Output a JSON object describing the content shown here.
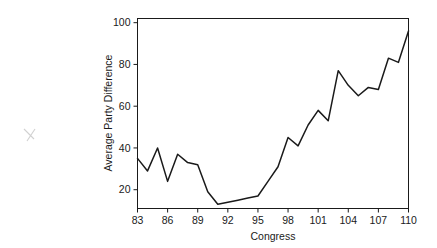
{
  "chart_data": {
    "type": "line",
    "title": "",
    "xlabel": "Congress",
    "ylabel": "Average Party Difference",
    "xlim": [
      83,
      110
    ],
    "ylim": [
      11,
      102
    ],
    "grid": false,
    "legend": null,
    "xticks": [
      83,
      86,
      89,
      92,
      95,
      98,
      101,
      104,
      107,
      110
    ],
    "xtick_labels": [
      "83",
      "86",
      "89",
      "92",
      "95",
      "98",
      "101",
      "104",
      "107",
      "110"
    ],
    "yticks": [
      20,
      40,
      60,
      80,
      100
    ],
    "ytick_labels": [
      "20",
      "40",
      "60",
      "80",
      "100"
    ],
    "series": [
      {
        "name": "Average Party Difference",
        "color": "#1a1a1a",
        "x": [
          83,
          84,
          85,
          86,
          87,
          88,
          89,
          90,
          91,
          92,
          93,
          94,
          95,
          96,
          97,
          98,
          99,
          100,
          101,
          102,
          103,
          104,
          105,
          106,
          107,
          108,
          109,
          110
        ],
        "values": [
          35,
          29,
          40,
          24,
          37,
          33,
          32,
          19,
          13,
          14,
          15,
          16,
          17,
          24,
          31,
          45,
          41,
          51,
          58,
          53,
          77,
          70,
          65,
          69,
          68,
          83,
          81,
          96
        ]
      }
    ]
  },
  "axes": {
    "x_title": "Congress",
    "y_title": "Average Party Difference"
  },
  "annotation": {
    "stray_mark": "pencil-x-mark"
  }
}
